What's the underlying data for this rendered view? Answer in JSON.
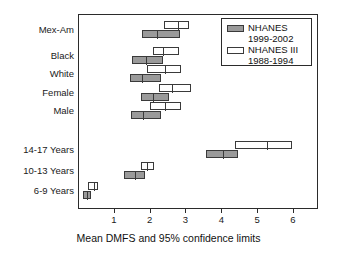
{
  "chart_data": {
    "type": "bar",
    "orientation": "horizontal",
    "title": "",
    "xlabel": "Mean DMFS and 95% confidence limits",
    "ylabel": "",
    "xlim": [
      0,
      6.7
    ],
    "xticks": [
      1,
      2,
      3,
      4,
      5,
      6
    ],
    "xticklabels": [
      "1",
      "2",
      "3",
      "4",
      "5",
      "6"
    ],
    "grid": false,
    "legend_position": "top-right",
    "legend": [
      {
        "key": "nhanes_9902",
        "label": "NHANES",
        "sublabel": "1999-2002",
        "style": "filled",
        "color": "#9a9a9a"
      },
      {
        "key": "nhanes_iii",
        "label": "NHANES III",
        "sublabel": "1988-1994",
        "style": "open",
        "color": "#ffffff"
      }
    ],
    "categories": [
      "Mex-Am",
      "Black",
      "White",
      "Female",
      "Male",
      "",
      "14-17 Years",
      "10-13 Years",
      "6-9 Years"
    ],
    "series": [
      {
        "name": "NHANES 1999-2002",
        "style": "filled",
        "points": [
          {
            "category": "Mex-Am",
            "mean": 2.2,
            "low": 1.8,
            "high": 2.85
          },
          {
            "category": "Black",
            "mean": 1.9,
            "low": 1.52,
            "high": 2.38
          },
          {
            "category": "White",
            "mean": 1.78,
            "low": 1.44,
            "high": 2.33
          },
          {
            "category": "Female",
            "mean": 2.1,
            "low": 1.75,
            "high": 2.55
          },
          {
            "category": "Male",
            "mean": 1.82,
            "low": 1.47,
            "high": 2.33
          },
          {
            "category": "14-17 Years",
            "mean": 4.05,
            "low": 3.57,
            "high": 4.48
          },
          {
            "category": "10-13 Years",
            "mean": 1.58,
            "low": 1.28,
            "high": 1.86
          },
          {
            "category": "6-9 Years",
            "mean": 0.26,
            "low": 0.14,
            "high": 0.37
          }
        ]
      },
      {
        "name": "NHANES III 1988-1994",
        "style": "open",
        "points": [
          {
            "category": "Mex-Am",
            "mean": 2.78,
            "low": 2.41,
            "high": 3.1
          },
          {
            "category": "Black",
            "mean": 2.38,
            "low": 2.1,
            "high": 2.82
          },
          {
            "category": "White",
            "mean": 2.42,
            "low": 1.94,
            "high": 2.88
          },
          {
            "category": "Female",
            "mean": 2.62,
            "low": 2.27,
            "high": 3.16
          },
          {
            "category": "Male",
            "mean": 2.42,
            "low": 2.0,
            "high": 2.88
          },
          {
            "category": "14-17 Years",
            "mean": 5.28,
            "low": 4.37,
            "high": 5.97
          },
          {
            "category": "10-13 Years",
            "mean": 1.93,
            "low": 1.77,
            "high": 2.11
          },
          {
            "category": "6-9 Years",
            "mean": 0.45,
            "low": 0.28,
            "high": 0.56
          }
        ]
      }
    ]
  }
}
